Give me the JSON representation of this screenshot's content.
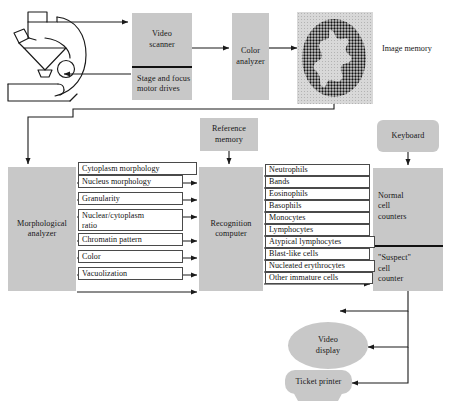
{
  "diagram": {
    "colors": {
      "box_fill": "#c8c8c8",
      "line": "#1a1a1a",
      "label_fill": "#ffffff",
      "label_border": "#4a4a4a",
      "halftone_bg": "#cfcfcf",
      "halftone_cell": "#101010"
    }
  },
  "blocks": {
    "microscope": {
      "name": "microscope",
      "label": ""
    },
    "video_scanner": {
      "label": "Video\nscanner"
    },
    "stage_motor": {
      "label": "Stage and focus\nmotor drives"
    },
    "color_analyzer": {
      "label": "Color\nanalyzer"
    },
    "image_memory_caption": {
      "label": "Image memory"
    },
    "reference_memory": {
      "label": "Reference\nmemory"
    },
    "keyboard": {
      "label": "Keyboard"
    },
    "morphological_analyzer": {
      "label": "Morphological\nanalyzer"
    },
    "recognition_computer": {
      "label": "Recognition\ncomputer"
    },
    "normal_cell_counters": {
      "label": "Normal\ncell\ncounters"
    },
    "suspect_cell_counter": {
      "label": "\"Suspect\"\ncell\ncounter"
    },
    "video_display": {
      "label": "Video\ndisplay"
    },
    "ticket_printer": {
      "label": "Ticket printer"
    }
  },
  "feature_signals": [
    {
      "label": "Cytoplasm morphology"
    },
    {
      "label": "Nucleus morphology"
    },
    {
      "label": "Granularity"
    },
    {
      "label": "Nuclear/cytoplasm\nratio"
    },
    {
      "label": "Chromatin pattern"
    },
    {
      "label": "Color"
    },
    {
      "label": "Vacuolization"
    }
  ],
  "cell_classes": [
    {
      "label": "Neutrophils",
      "group": "normal"
    },
    {
      "label": "Bands",
      "group": "normal"
    },
    {
      "label": "Eosinophils",
      "group": "normal"
    },
    {
      "label": "Basophils",
      "group": "normal"
    },
    {
      "label": "Monocytes",
      "group": "normal"
    },
    {
      "label": "Lymphocytes",
      "group": "normal"
    },
    {
      "label": "Atypical lymphocytes",
      "group": "suspect"
    },
    {
      "label": "Blast-like cells",
      "group": "suspect"
    },
    {
      "label": "Nucleated erythrocytes",
      "group": "suspect"
    },
    {
      "label": "Other immature cells",
      "group": "suspect"
    }
  ]
}
